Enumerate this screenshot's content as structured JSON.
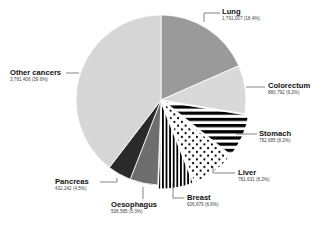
{
  "chart_data": {
    "type": "pie",
    "title": "",
    "start_angle_deg": 0,
    "direction": "clockwise",
    "slices": [
      {
        "label": "Lung",
        "value": 1761007,
        "value_text": "1,761,007 (18.4%)",
        "percent": 18.4,
        "fill": "#9a9a9a",
        "pattern": "solid",
        "explode": 0
      },
      {
        "label": "Colorectum",
        "value": 880792,
        "value_text": "880,792 (9.2%)",
        "percent": 9.2,
        "fill": "#d9d9d9",
        "pattern": "solid",
        "explode": 0
      },
      {
        "label": "Stomach",
        "value": 782685,
        "value_text": "782,685 (8.2%)",
        "percent": 8.2,
        "fill": "#000000",
        "pattern": "horizontal-stripes",
        "explode": 4
      },
      {
        "label": "Liver",
        "value": 781631,
        "value_text": "781,631 (8.2%)",
        "percent": 8.2,
        "fill": "#000000",
        "pattern": "dots",
        "explode": 4
      },
      {
        "label": "Breast",
        "value": 626679,
        "value_text": "626,679 (6.6%)",
        "percent": 6.6,
        "fill": "#000000",
        "pattern": "vertical-stripes",
        "explode": 4
      },
      {
        "label": "Oesophagus",
        "value": 508585,
        "value_text": "508,585 (5.3%)",
        "percent": 5.3,
        "fill": "#6e6e6e",
        "pattern": "solid",
        "explode": 0
      },
      {
        "label": "Pancreas",
        "value": 432242,
        "value_text": "432,242 (4.5%)",
        "percent": 4.5,
        "fill": "#2a2a2a",
        "pattern": "solid",
        "explode": 0
      },
      {
        "label": "Other cancers",
        "value": 3781406,
        "value_text": "3,781,406 (39.6%)",
        "percent": 39.6,
        "fill": "#d6d6d6",
        "pattern": "solid",
        "explode": 0
      }
    ]
  },
  "layout": {
    "center": [
      161,
      100
    ],
    "radius": 85,
    "labels": [
      {
        "slice": 0,
        "x": 222,
        "y": 8,
        "align": "left",
        "leader": [
          [
            204,
            22
          ],
          [
            204,
            13
          ],
          [
            220,
            13
          ]
        ]
      },
      {
        "slice": 1,
        "x": 268,
        "y": 82,
        "align": "left",
        "leader": [
          [
            246,
            87
          ],
          [
            265,
            87
          ]
        ]
      },
      {
        "slice": 2,
        "x": 259,
        "y": 130,
        "align": "left",
        "leader": [
          [
            236,
            134
          ],
          [
            257,
            134
          ]
        ]
      },
      {
        "slice": 3,
        "x": 238,
        "y": 169,
        "align": "left",
        "leader": [
          [
            213,
            167
          ],
          [
            213,
            173
          ],
          [
            235,
            173
          ]
        ]
      },
      {
        "slice": 4,
        "x": 187,
        "y": 194,
        "align": "left",
        "leader": [
          [
            173,
            183
          ],
          [
            173,
            198
          ],
          [
            184,
            198
          ]
        ]
      },
      {
        "slice": 5,
        "x": 111,
        "y": 201,
        "align": "left",
        "leader": [
          [
            143,
            187
          ],
          [
            143,
            199
          ]
        ]
      },
      {
        "slice": 6,
        "x": 55,
        "y": 178,
        "align": "left",
        "leader": [
          [
            117,
            178
          ],
          [
            117,
            182
          ],
          [
            100,
            182
          ]
        ]
      },
      {
        "slice": 7,
        "x": 10,
        "y": 69,
        "align": "left",
        "leader": [
          [
            66,
            73
          ],
          [
            79,
            73
          ]
        ]
      }
    ]
  }
}
